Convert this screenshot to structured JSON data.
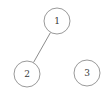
{
  "diagram": {
    "type": "graph",
    "background_color": "#ffffff",
    "node_stroke_color": "#9a9a9a",
    "node_fill_color": "#ffffff",
    "edge_color": "#8c8c8c",
    "label_color": "#383838",
    "canvas": {
      "width": 109,
      "height": 98
    },
    "nodes": [
      {
        "id": "1",
        "label": "1",
        "x": 57,
        "y": 21,
        "r": 13
      },
      {
        "id": "2",
        "label": "2",
        "x": 27,
        "y": 74,
        "r": 13
      },
      {
        "id": "3",
        "label": "3",
        "x": 87,
        "y": 73,
        "r": 13
      }
    ],
    "edges": [
      {
        "from": "1",
        "to": "2"
      }
    ]
  }
}
